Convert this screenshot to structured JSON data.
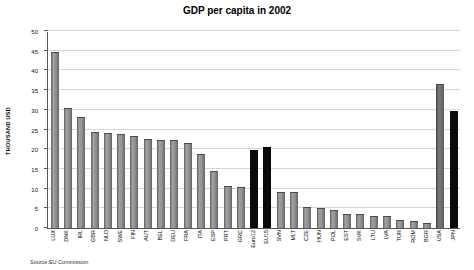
{
  "title": "GDP per capita in 2002",
  "source": "Source:EU Commission",
  "y_axis": {
    "label": "THOUSAND USD",
    "ticks": [
      0,
      5,
      10,
      15,
      20,
      25,
      30,
      35,
      40,
      45,
      50
    ]
  },
  "chart_data": {
    "type": "bar",
    "title": "GDP per capita in 2002",
    "xlabel": "",
    "ylabel": "THOUSAND USD",
    "ylim": [
      0,
      50
    ],
    "grid": true,
    "legend": false,
    "source": "Source:EU Commission",
    "categories": [
      "LUX",
      "DNK",
      "IRL",
      "GBR",
      "NLD",
      "SWE",
      "FIN",
      "AUT",
      "BEL",
      "DEU",
      "FRA",
      "ITA",
      "ESP",
      "PRT",
      "GRC",
      "Euro12",
      "EU15",
      "SVN",
      "MLT",
      "CZE",
      "HUN",
      "POL",
      "EST",
      "SVK",
      "LTU",
      "LVA",
      "TUR",
      "ROM",
      "BGR",
      "USA",
      "JPN"
    ],
    "values": [
      44.3,
      30.1,
      28.0,
      24.1,
      23.9,
      23.7,
      23.0,
      22.4,
      22.1,
      22.0,
      21.2,
      18.5,
      14.1,
      10.5,
      10.2,
      19.6,
      20.4,
      9.0,
      8.9,
      5.1,
      4.7,
      4.2,
      3.4,
      3.2,
      2.8,
      2.7,
      1.9,
      1.4,
      1.1,
      36.4,
      29.4
    ],
    "black_bars": [
      "Euro12",
      "EU15",
      "JPN"
    ],
    "dark_bars": [
      "USA"
    ],
    "colors": {
      "bar_default": "#8d8d8d",
      "bar_dark": "#5e5e5e",
      "bar_black": "#0a0a0a",
      "gridline": "#d6d6d6",
      "axis": "#555555"
    }
  }
}
